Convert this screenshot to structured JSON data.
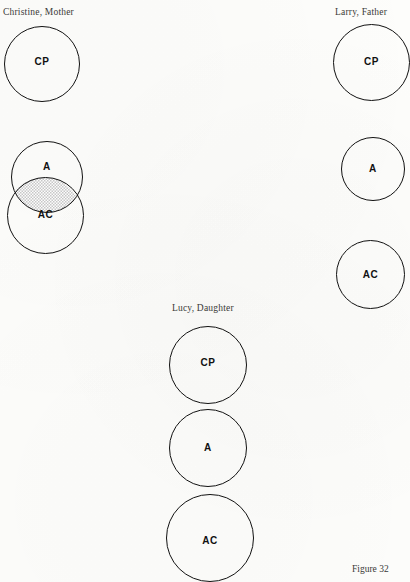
{
  "figure": {
    "caption": "Figure 32",
    "caption_position": {
      "left": 352,
      "top": 565
    }
  },
  "persons": [
    {
      "id": "christine",
      "label": "Christine, Mother",
      "label_position": {
        "left": 3,
        "top": 8
      },
      "circles": [
        {
          "id": "christine-cp",
          "label": "CP",
          "left": 4,
          "top": 26,
          "size": 76,
          "label_top": 57
        },
        {
          "id": "christine-a",
          "label": "A",
          "left": 11,
          "top": 141,
          "size": 72,
          "label_top": 162
        },
        {
          "id": "christine-ac",
          "label": "AC",
          "left": 7,
          "top": 177,
          "size": 77,
          "label_top": 210
        }
      ],
      "overlap": {
        "id": "christine-a-ac-overlap",
        "description": "shaded lens where A and AC circles intersect",
        "left": 13,
        "top": 179,
        "width": 68,
        "height": 25,
        "fill": "#d8d8d8"
      }
    },
    {
      "id": "larry",
      "label": "Larry, Father",
      "label_position": {
        "left": 335,
        "top": 8
      },
      "circles": [
        {
          "id": "larry-cp",
          "label": "CP",
          "left": 333,
          "top": 24,
          "size": 77,
          "label_top": 57
        },
        {
          "id": "larry-a",
          "label": "A",
          "left": 341,
          "top": 137,
          "size": 64,
          "label_top": 164
        },
        {
          "id": "larry-ac",
          "label": "AC",
          "left": 336,
          "top": 240,
          "size": 69,
          "label_top": 270
        }
      ],
      "overlap": null
    },
    {
      "id": "lucy",
      "label": "Lucy, Daughter",
      "label_position": {
        "left": 172,
        "top": 304
      },
      "circles": [
        {
          "id": "lucy-cp",
          "label": "CP",
          "left": 169,
          "top": 326,
          "size": 78,
          "label_top": 358
        },
        {
          "id": "lucy-a",
          "label": "A",
          "left": 169,
          "top": 409,
          "size": 78,
          "label_top": 443
        },
        {
          "id": "lucy-ac",
          "label": "AC",
          "left": 166,
          "top": 494,
          "size": 88,
          "label_top": 536
        }
      ],
      "overlap": null
    }
  ],
  "colors": {
    "page_background": "#fdfdfb",
    "ink": "#111111",
    "label_ink": "#3a3a38",
    "overlap_fill": "#d8d8d8"
  }
}
